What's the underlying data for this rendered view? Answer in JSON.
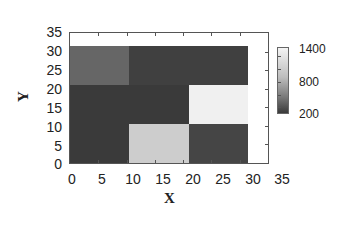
{
  "chart_data": {
    "type": "heatmap",
    "title": "",
    "xlabel": "X",
    "ylabel": "Y",
    "xlim": [
      0,
      35
    ],
    "ylim": [
      0,
      35
    ],
    "x_ticks": [
      "0",
      "5",
      "10",
      "15",
      "20",
      "25",
      "30",
      "35"
    ],
    "y_ticks": [
      "0",
      "5",
      "10",
      "15",
      "20",
      "25",
      "30",
      "35"
    ],
    "grid": false,
    "colormap": "grayscale (dark = low, light = high)",
    "colorbar": {
      "min": 200,
      "max": 1400,
      "tick_labels": [
        "1400",
        "800",
        "200"
      ],
      "position": "right"
    },
    "x_bins": [
      [
        0,
        10.5
      ],
      [
        10.5,
        21
      ],
      [
        21,
        31.5
      ]
    ],
    "y_bins": [
      [
        0,
        10.5
      ],
      [
        10.5,
        21
      ],
      [
        21,
        31.5
      ]
    ],
    "cells": [
      {
        "x": [
          0,
          10.5
        ],
        "y": [
          21,
          31.5
        ],
        "value": 500,
        "color": "#666666"
      },
      {
        "x": [
          10.5,
          21
        ],
        "y": [
          21,
          31.5
        ],
        "value": 250,
        "color": "#404040"
      },
      {
        "x": [
          21,
          31.5
        ],
        "y": [
          21,
          31.5
        ],
        "value": 250,
        "color": "#404040"
      },
      {
        "x": [
          0,
          10.5
        ],
        "y": [
          10.5,
          21
        ],
        "value": 220,
        "color": "#3a3a3a"
      },
      {
        "x": [
          10.5,
          21
        ],
        "y": [
          10.5,
          21
        ],
        "value": 220,
        "color": "#3a3a3a"
      },
      {
        "x": [
          21,
          31.5
        ],
        "y": [
          10.5,
          21
        ],
        "value": 1400,
        "color": "#f0f0f0"
      },
      {
        "x": [
          0,
          10.5
        ],
        "y": [
          0,
          10.5
        ],
        "value": 220,
        "color": "#3a3a3a"
      },
      {
        "x": [
          10.5,
          21
        ],
        "y": [
          0,
          10.5
        ],
        "value": 1150,
        "color": "#cdcdcd"
      },
      {
        "x": [
          21,
          31.5
        ],
        "y": [
          0,
          10.5
        ],
        "value": 280,
        "color": "#454545"
      }
    ],
    "matrix_rows_top_to_bottom": [
      [
        500,
        250,
        250
      ],
      [
        220,
        220,
        1400
      ],
      [
        220,
        1150,
        280
      ]
    ]
  },
  "axes": {
    "xlabel": "X",
    "ylabel": "Y",
    "x_ticks": [
      "0",
      "5",
      "10",
      "15",
      "20",
      "25",
      "30",
      "35"
    ],
    "y_ticks": [
      "35",
      "30",
      "25",
      "20",
      "15",
      "10",
      "5",
      "0"
    ]
  },
  "colorbar": {
    "labels": [
      "1400",
      "800",
      "200"
    ]
  }
}
